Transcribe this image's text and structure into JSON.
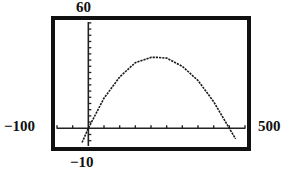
{
  "chart_data": {
    "type": "line",
    "title": "",
    "xlabel": "",
    "ylabel": "",
    "xlim": [
      -100,
      500
    ],
    "ylim": [
      -10,
      60
    ],
    "window_labels": {
      "xmin": "−100",
      "xmax": "500",
      "ymin": "−10",
      "ymax": "60"
    },
    "grid": false,
    "legend": null,
    "series": [
      {
        "name": "parabola",
        "style": "dotted-pixel",
        "x": [
          -20,
          0,
          50,
          100,
          150,
          200,
          220,
          250,
          300,
          350,
          400,
          440,
          470
        ],
        "values": [
          -8,
          0,
          17,
          29,
          37,
          40,
          40,
          39.6,
          35,
          27,
          15,
          3,
          -6
        ]
      }
    ],
    "x_tick_count": 11,
    "y_tick_count": 20
  },
  "colors": {
    "frame": "#111111",
    "curve": "#1a1a1a",
    "background": "#ffffff"
  }
}
